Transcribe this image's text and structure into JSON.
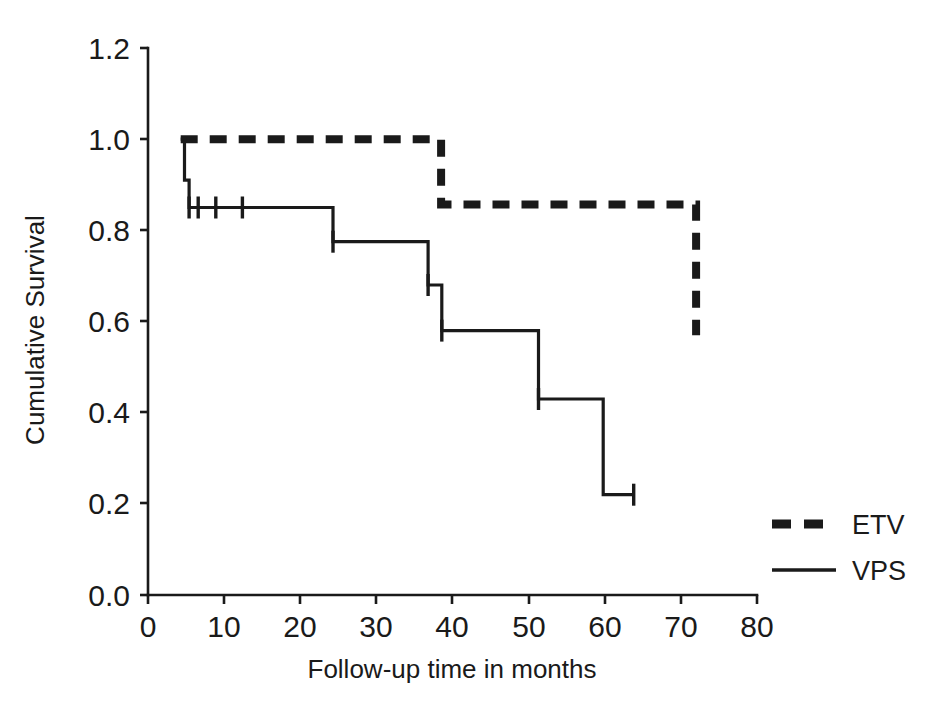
{
  "chart_data": {
    "type": "line",
    "title": "",
    "subtitle": "",
    "xlabel": "Follow-up time in months",
    "ylabel": "Cumulative Survival",
    "xlim": [
      0,
      80
    ],
    "ylim": [
      0.0,
      1.2
    ],
    "xticks": [
      0,
      10,
      20,
      30,
      40,
      50,
      60,
      70,
      80
    ],
    "xtick_labels": [
      "0",
      "10",
      "20",
      "30",
      "40",
      "50",
      "60",
      "70",
      "80"
    ],
    "yticks": [
      0.0,
      0.2,
      0.4,
      0.6,
      0.8,
      1.0,
      1.2
    ],
    "ytick_labels": [
      "0.0",
      "0.2",
      "0.4",
      "0.6",
      "0.8",
      "1.0",
      "1.2"
    ],
    "grid": false,
    "legend_position": "right",
    "plot_style": "kaplan-meier step",
    "series": [
      {
        "name": "ETV",
        "line_style": "dashed",
        "line_width": 8,
        "color": "#1a1a1a",
        "steps": [
          {
            "x": 4.3,
            "y": 1.0
          },
          {
            "x": 38.5,
            "y": 1.0
          },
          {
            "x": 38.5,
            "y": 0.857
          },
          {
            "x": 72.0,
            "y": 0.857
          },
          {
            "x": 72.0,
            "y": 0.57
          }
        ],
        "censor_marks": []
      },
      {
        "name": "VPS",
        "line_style": "solid",
        "line_width": 3,
        "color": "#1a1a1a",
        "steps": [
          {
            "x": 4.3,
            "y": 1.0
          },
          {
            "x": 4.8,
            "y": 1.0
          },
          {
            "x": 4.8,
            "y": 0.91
          },
          {
            "x": 5.4,
            "y": 0.91
          },
          {
            "x": 5.4,
            "y": 0.85
          },
          {
            "x": 24.3,
            "y": 0.85
          },
          {
            "x": 24.3,
            "y": 0.775
          },
          {
            "x": 36.8,
            "y": 0.775
          },
          {
            "x": 36.8,
            "y": 0.68
          },
          {
            "x": 38.6,
            "y": 0.68
          },
          {
            "x": 38.6,
            "y": 0.58
          },
          {
            "x": 51.3,
            "y": 0.58
          },
          {
            "x": 51.3,
            "y": 0.43
          },
          {
            "x": 59.8,
            "y": 0.43
          },
          {
            "x": 59.8,
            "y": 0.22
          },
          {
            "x": 63.8,
            "y": 0.22
          }
        ],
        "censor_marks": [
          {
            "x": 5.4,
            "y": 0.85
          },
          {
            "x": 6.6,
            "y": 0.85
          },
          {
            "x": 8.9,
            "y": 0.85
          },
          {
            "x": 12.4,
            "y": 0.85
          },
          {
            "x": 24.3,
            "y": 0.775
          },
          {
            "x": 36.8,
            "y": 0.68
          },
          {
            "x": 38.6,
            "y": 0.58
          },
          {
            "x": 51.3,
            "y": 0.43
          },
          {
            "x": 63.8,
            "y": 0.22
          }
        ]
      }
    ]
  },
  "legend": {
    "entries": [
      {
        "label": "ETV",
        "style": "dashed"
      },
      {
        "label": "VPS",
        "style": "solid"
      }
    ]
  },
  "axes": {
    "x_title": "Follow-up time in months",
    "y_title": "Cumulative Survival"
  },
  "colors": {
    "ink": "#1a1a1a",
    "background": "#ffffff"
  }
}
